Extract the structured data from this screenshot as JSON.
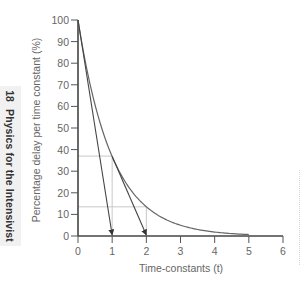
{
  "sidebar": {
    "page_number": "18",
    "book_title": "Physics for the Intensivist"
  },
  "chart_data": {
    "type": "line",
    "title": "",
    "xlabel": "Time-constants (t)",
    "ylabel": "Percentage delay per time constant (%)",
    "xlim": [
      0,
      6
    ],
    "ylim": [
      0,
      100
    ],
    "x_ticks": [
      "0",
      "1",
      "2",
      "3",
      "4",
      "5",
      "6"
    ],
    "y_ticks": [
      "0",
      "10",
      "20",
      "30",
      "40",
      "50",
      "60",
      "70",
      "80",
      "90",
      "100"
    ],
    "grid": false,
    "legend": null,
    "series": [
      {
        "name": "Exponential decay curve",
        "x": [
          0,
          0.5,
          1,
          1.5,
          2,
          2.5,
          3,
          3.5,
          4,
          4.5,
          5
        ],
        "y": [
          100,
          60.7,
          36.8,
          22.3,
          13.5,
          8.2,
          5.0,
          3.0,
          1.8,
          1.1,
          0.7
        ]
      },
      {
        "name": "Initial tangent (arrow)",
        "x": [
          0,
          1
        ],
        "y": [
          100,
          0
        ]
      },
      {
        "name": "Tangent at t=1 (arrow)",
        "x": [
          1,
          2
        ],
        "y": [
          36.8,
          0
        ]
      }
    ],
    "annotations": [
      {
        "type": "guide-horizontal",
        "y": 37,
        "x_range": [
          0,
          1
        ]
      },
      {
        "type": "guide-vertical",
        "x": 1,
        "y_range": [
          0,
          37
        ]
      },
      {
        "type": "guide-horizontal",
        "y": 13.5,
        "x_range": [
          0,
          2
        ]
      },
      {
        "type": "guide-vertical",
        "x": 2,
        "y_range": [
          0,
          13.5
        ]
      }
    ]
  }
}
